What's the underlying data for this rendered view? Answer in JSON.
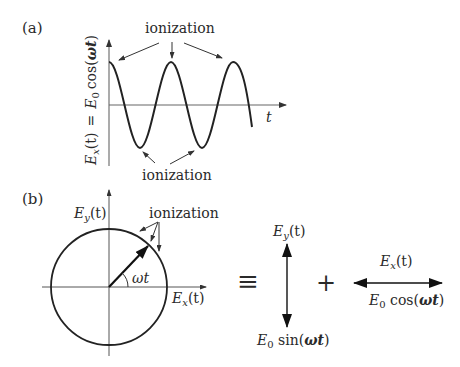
{
  "panel_a": {
    "label": "(a)",
    "ylabel": {
      "lhs": "E",
      "lhs_sub": "x",
      "lhs_arg": "(t)",
      "eq": "=",
      "rhs": "E",
      "rhs_sub": "0",
      "rhs_fn": "cos(",
      "rhs_var": "ωt",
      "rhs_close": ")"
    },
    "xlabel": "t",
    "top_annotation": "ionization",
    "bottom_annotation": "ionization"
  },
  "panel_b": {
    "label": "(b)",
    "y_axis_label": {
      "base": "E",
      "sub": "y",
      "arg": "(t)"
    },
    "x_axis_label": {
      "base": "E",
      "sub": "x",
      "arg": "(t)"
    },
    "angle_label": "ωt",
    "annotation": "ionization",
    "equiv_symbol": "≡",
    "plus_symbol": "+",
    "vertical_component": {
      "top": {
        "base": "E",
        "sub": "y",
        "arg": "(t)"
      },
      "bottom": {
        "base": "E",
        "sub": "0",
        "fn": " sin(",
        "var": "ωt",
        "close": ")"
      }
    },
    "horizontal_component": {
      "top": {
        "base": "E",
        "sub": "x",
        "arg": "(t)"
      },
      "bottom": {
        "base": "E",
        "sub": "0",
        "fn": " cos(",
        "var": "ωt",
        "close": ")"
      }
    }
  },
  "colors": {
    "stroke": "#222222",
    "axis": "#555555",
    "text": "#2a2a2a"
  }
}
